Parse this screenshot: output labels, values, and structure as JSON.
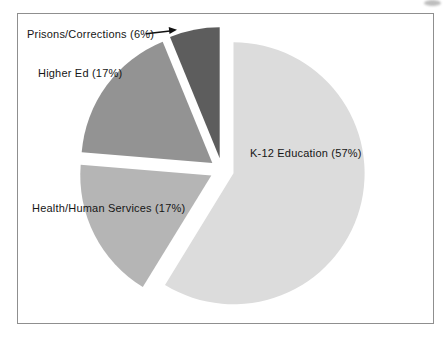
{
  "page": {
    "background": "#ffffff",
    "frame_border_color": "#8f8f8f"
  },
  "chart_data": {
    "type": "pie",
    "title": "",
    "categories": [
      "K-12 Education",
      "Health/Human Services",
      "Higher Ed",
      "Prisons/Corrections"
    ],
    "values": [
      57,
      17,
      17,
      6
    ],
    "value_unit": "percent",
    "direction": "clockwise",
    "start_angle_deg": 0,
    "exploded": true,
    "legend": "none",
    "slices": [
      {
        "category": "K-12 Education",
        "value": 57,
        "label": "K-12 Education (57%)",
        "color": "#dcdcdc",
        "label_placement": "inside"
      },
      {
        "category": "Health/Human Services",
        "value": 17,
        "label": "Health/Human Services (17%)",
        "color": "#b5b5b5",
        "label_placement": "inside-left"
      },
      {
        "category": "Higher Ed",
        "value": 17,
        "label": "Higher Ed (17%)",
        "color": "#939393",
        "label_placement": "outside-left"
      },
      {
        "category": "Prisons/Corrections",
        "value": 6,
        "label": "Prisons/Corrections (6%)",
        "color": "#5d5d5d",
        "label_placement": "outside-callout"
      }
    ],
    "annotations": [
      {
        "type": "arrow",
        "from_label": "Prisons/Corrections (6%)",
        "points_to": "Prisons/Corrections slice",
        "color": "#111111"
      }
    ]
  }
}
